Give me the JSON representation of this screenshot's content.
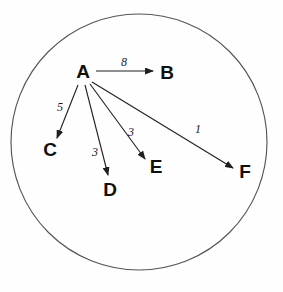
{
  "figure": {
    "type": "directed-graph",
    "background_color": "#fefefe",
    "boundary": {
      "shape": "circle",
      "cx": 139,
      "cy": 142,
      "r": 128,
      "stroke_color": "#555555"
    },
    "node_color": "#101010",
    "edge_color": "#1f1f1f"
  },
  "nodes": [
    {
      "id": "A",
      "label": "A",
      "x": 83,
      "y": 73
    },
    {
      "id": "B",
      "label": "B",
      "x": 167,
      "y": 74
    },
    {
      "id": "C",
      "label": "C",
      "x": 50,
      "y": 151
    },
    {
      "id": "D",
      "label": "D",
      "x": 110,
      "y": 191
    },
    {
      "id": "E",
      "label": "E",
      "x": 156,
      "y": 168
    },
    {
      "id": "F",
      "label": "F",
      "x": 245,
      "y": 173
    }
  ],
  "edges": [
    {
      "from": "A",
      "to": "B",
      "weight": "8",
      "x1": 96,
      "y1": 71,
      "x2": 153,
      "y2": 71,
      "label_x": 124,
      "label_y": 63
    },
    {
      "from": "A",
      "to": "C",
      "weight": "5",
      "x1": 78,
      "y1": 85,
      "x2": 57,
      "y2": 138,
      "label_x": 60,
      "label_y": 108
    },
    {
      "from": "A",
      "to": "D",
      "weight": "3",
      "x1": 85,
      "y1": 85,
      "x2": 108,
      "y2": 175,
      "label_x": 95,
      "label_y": 153
    },
    {
      "from": "A",
      "to": "E",
      "weight": "3",
      "x1": 90,
      "y1": 84,
      "x2": 145,
      "y2": 159,
      "label_x": 131,
      "label_y": 133
    },
    {
      "from": "A",
      "to": "F",
      "weight": "1",
      "x1": 92,
      "y1": 82,
      "x2": 233,
      "y2": 168,
      "label_x": 198,
      "label_y": 130
    }
  ]
}
